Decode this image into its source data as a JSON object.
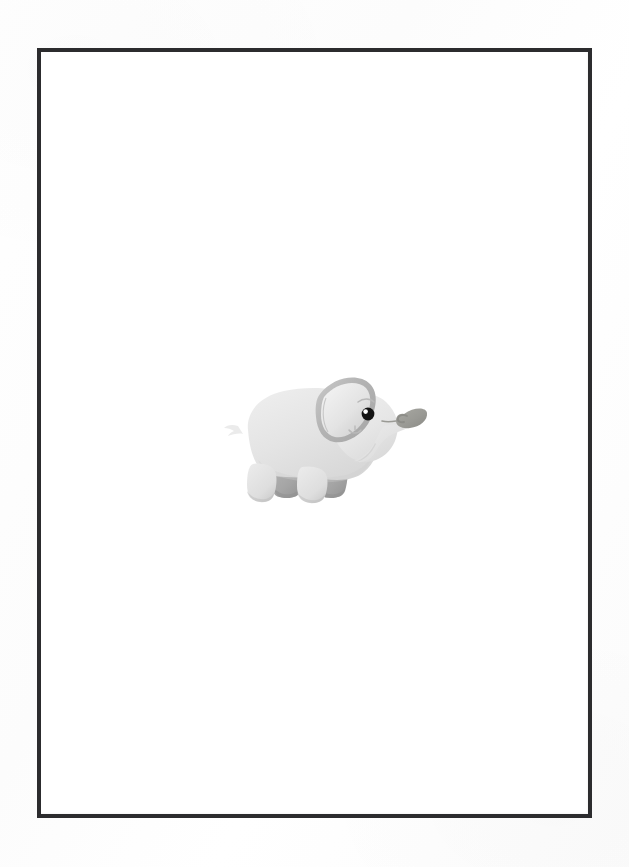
{
  "page": {
    "width": 629,
    "height": 867,
    "background_color": "#fdfdfd",
    "paper_tone": "#ffffff"
  },
  "frame": {
    "name": "border-frame",
    "left": 37,
    "top": 48,
    "width": 555,
    "height": 770,
    "border_width": 4,
    "border_color": "#2c2c2e",
    "fill_color": "#ffffff"
  },
  "artwork": {
    "subject": "baby-elephant",
    "title": "Baby Elephant",
    "style": "flat vector cartoon with soft gradients",
    "left": 214,
    "top": 360,
    "width": 210,
    "height": 148,
    "palette": {
      "body_light": "#e9e9e9",
      "body_mid": "#dedede",
      "body_shadow": "#cfcfcf",
      "ear_outer": "#b9b9b9",
      "ear_inner": "#e4e4e4",
      "leg_back": "#a9a9a9",
      "leg_back_dark": "#9b9b9b",
      "trunk_tip": "#9a9a95",
      "trunk_tip_dark": "#8d8d88",
      "eye": "#141414",
      "eye_highlight": "#ffffff",
      "line": "#b4b4b4"
    },
    "parts": [
      {
        "name": "ear",
        "label": "Ear"
      },
      {
        "name": "head",
        "label": "Head"
      },
      {
        "name": "body",
        "label": "Body"
      },
      {
        "name": "trunk",
        "label": "Trunk"
      },
      {
        "name": "trunk-tip",
        "label": "Trunk tip leaf curl"
      },
      {
        "name": "eye",
        "label": "Eye"
      },
      {
        "name": "brow",
        "label": "Brow"
      },
      {
        "name": "mouth",
        "label": "Smile"
      },
      {
        "name": "front-leg",
        "label": "Front leg"
      },
      {
        "name": "back-leg",
        "label": "Back leg"
      },
      {
        "name": "tail",
        "label": "Tail"
      }
    ]
  },
  "accessibility": {
    "alt_text": "Cartoon baby elephant facing right inside a thin dark rectangular border on a white page"
  }
}
